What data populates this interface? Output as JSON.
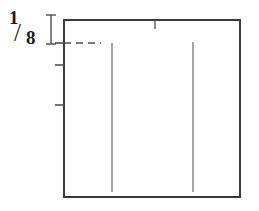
{
  "figure": {
    "background_color": "#ffffff",
    "line_color": "#4d4d4d",
    "dark_line_color": "#3a3a3a",
    "text_color": "#1a1a1a",
    "width": 259,
    "height": 211
  },
  "scale_label": {
    "name": "one-eighth-scale",
    "numerator": "1",
    "slash": "/",
    "denominator": "8",
    "full_text": "1/8"
  },
  "extent_bracket": {
    "name": "i-beam-extent-marker",
    "x": 51,
    "top_y": 15,
    "bottom_y": 44,
    "serif_half_width": 5
  },
  "frame": {
    "name": "outline-rectangle",
    "left": 64,
    "top": 20,
    "right": 240,
    "bottom": 197,
    "stroke_width": 2
  },
  "left_axis_ticks": [
    {
      "name": "tick-upper",
      "y": 43,
      "length": 9
    },
    {
      "name": "tick-middle",
      "y": 65,
      "length": 9
    },
    {
      "name": "tick-lower",
      "y": 105,
      "length": 9
    }
  ],
  "top_axis_ticks": [
    {
      "name": "tick-top-center",
      "x": 155,
      "length": 9
    }
  ],
  "dashed_guide": {
    "name": "dashed-reference-line",
    "y": 43,
    "x_start": 64,
    "x_end": 101,
    "dash_pattern": "7 5"
  },
  "interior_vertical_lines": [
    {
      "name": "vertical-line-left",
      "x": 112,
      "y_start": 43,
      "y_end": 192
    },
    {
      "name": "vertical-line-right",
      "x": 193,
      "y_start": 42,
      "y_end": 192
    }
  ],
  "chart_data": {
    "type": "diagram",
    "annotations": [
      "1/8"
    ],
    "elements": [
      "fraction-label",
      "i-beam-extent-marker",
      "outline-rectangle",
      "left-axis-ticks",
      "top-axis-tick",
      "dashed-reference-line",
      "interior-vertical-lines"
    ]
  }
}
